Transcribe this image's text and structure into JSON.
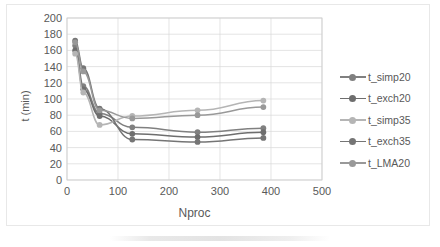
{
  "chart_data": {
    "type": "line",
    "title": "",
    "xlabel": "Nproc",
    "ylabel": "t (min)",
    "xlim": [
      0,
      500
    ],
    "ylim": [
      0,
      200
    ],
    "xticks": [
      0,
      100,
      200,
      300,
      400,
      500
    ],
    "yticks": [
      0,
      20,
      40,
      60,
      80,
      100,
      120,
      140,
      160,
      180,
      200
    ],
    "grid": true,
    "legend_position": "right",
    "markers": "circle",
    "x": [
      16,
      32,
      64,
      128,
      256,
      385
    ],
    "series": [
      {
        "name": "t_simp20",
        "color": "#808080",
        "values": [
          166,
          116,
          82,
          65,
          59,
          64
        ]
      },
      {
        "name": "t_exch20",
        "color": "#6e6e6e",
        "values": [
          160,
          112,
          79,
          57,
          53,
          59
        ]
      },
      {
        "name": "t_simp35",
        "color": "#b5b5b5",
        "values": [
          156,
          108,
          68,
          79,
          86,
          98
        ]
      },
      {
        "name": "t_exch35",
        "color": "#757575",
        "values": [
          172,
          138,
          88,
          50,
          47,
          52
        ]
      },
      {
        "name": "t_LMA20",
        "color": "#999999",
        "values": [
          170,
          134,
          86,
          76,
          80,
          90
        ]
      }
    ]
  },
  "axis": {
    "x_title": "Nproc",
    "y_title": "t (min)",
    "x_tick_labels": [
      "0",
      "100",
      "200",
      "300",
      "400",
      "500"
    ],
    "y_tick_labels": [
      "0",
      "20",
      "40",
      "60",
      "80",
      "100",
      "120",
      "140",
      "160",
      "180",
      "200"
    ]
  },
  "legend": {
    "items": [
      {
        "label": "t_simp20"
      },
      {
        "label": "t_exch20"
      },
      {
        "label": "t_simp35"
      },
      {
        "label": "t_exch35"
      },
      {
        "label": "t_LMA20"
      }
    ]
  },
  "colors": {
    "grid": "#d9d9d9",
    "frame": "#d0d0d0",
    "text": "#595959",
    "background": "#ffffff"
  }
}
